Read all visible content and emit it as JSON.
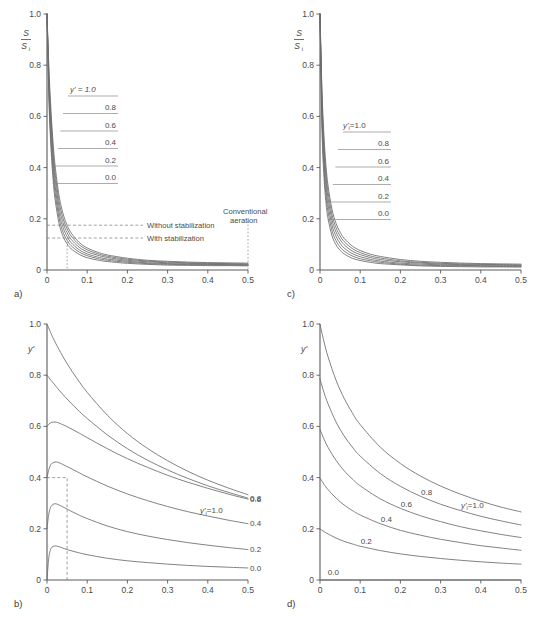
{
  "figure": {
    "panels": [
      "a",
      "b",
      "c",
      "d"
    ],
    "letters": {
      "a": "a)",
      "b": "b)",
      "c": "c)",
      "d": "d)"
    }
  },
  "axis": {
    "x_ticks": [
      "0",
      "0.1",
      "0.2",
      "0.3",
      "0.4",
      "0.5"
    ],
    "y_ticks": [
      "0",
      "0.2",
      "0.4",
      "0.6",
      "0.8",
      "1.0"
    ],
    "y_label_ac_numerator": "S",
    "y_label_ac_denominator": "S",
    "y_label_ac_denominator_sub": "i",
    "y_label_bd": "y'"
  },
  "panel_a": {
    "letter": "a)",
    "legend_head": "y' = 1.0",
    "legend_values": [
      "0.8",
      "0.6",
      "0.4",
      "0.2",
      "0.0"
    ],
    "annotation_without": "Without stabilization",
    "annotation_with": "With stabilization",
    "annotation_conventional_line1": "Conventional",
    "annotation_conventional_line2": "aeration",
    "without_stabilization_value": 0.175,
    "with_stabilization_value": 0.125,
    "marker_x": 0.05,
    "conventional_x": 0.5
  },
  "panel_b": {
    "letter": "b)",
    "legend_head": "y'",
    "legend_head_sub": "i",
    "legend_head_eq": "=1.0",
    "legend_values": [
      "0.8",
      "0.6",
      "0.4",
      "0.2",
      "0.0"
    ],
    "marker_x": 0.05,
    "marker_y": 0.4
  },
  "panel_c": {
    "letter": "c)",
    "legend_head": "y'",
    "legend_head_sub": "i",
    "legend_head_eq": "=1.0",
    "legend_values": [
      "0.8",
      "0.6",
      "0.4",
      "0.2",
      "0.0"
    ]
  },
  "panel_d": {
    "letter": "d)",
    "legend_head": "y'",
    "legend_head_sub": "i",
    "legend_head_eq": "=1.0",
    "legend_values": [
      "0.8",
      "0.6",
      "0.4",
      "0.2",
      "0.0"
    ]
  },
  "colors": {
    "axis": "#5a5a5a",
    "curve": "#6b6b6b",
    "text": "#4a4a4a",
    "annotation": "#7a7a7a",
    "background": "#ffffff"
  },
  "chart_data": [
    {
      "type": "line",
      "panel": "a",
      "title": "",
      "xlabel": "",
      "ylabel": "S/Si",
      "xlim": [
        0,
        0.5
      ],
      "ylim": [
        0,
        1.0
      ],
      "xticks": [
        0,
        0.1,
        0.2,
        0.3,
        0.4,
        0.5
      ],
      "yticks": [
        0,
        0.2,
        0.4,
        0.6,
        0.8,
        1.0
      ],
      "grid": false,
      "legend_position": "inside-left",
      "x": [
        0,
        0.005,
        0.01,
        0.015,
        0.02,
        0.03,
        0.04,
        0.05,
        0.06,
        0.08,
        0.1,
        0.125,
        0.15,
        0.2,
        0.25,
        0.3,
        0.35,
        0.4,
        0.45,
        0.5
      ],
      "series": [
        {
          "name": "y' = 1.0",
          "values": [
            1.0,
            0.78,
            0.62,
            0.5,
            0.41,
            0.29,
            0.22,
            0.175,
            0.145,
            0.108,
            0.086,
            0.07,
            0.059,
            0.046,
            0.038,
            0.034,
            0.031,
            0.029,
            0.028,
            0.027
          ]
        },
        {
          "name": "0.8",
          "values": [
            1.0,
            0.755,
            0.592,
            0.472,
            0.383,
            0.268,
            0.202,
            0.161,
            0.133,
            0.099,
            0.079,
            0.064,
            0.054,
            0.042,
            0.035,
            0.031,
            0.028,
            0.026,
            0.025,
            0.024
          ]
        },
        {
          "name": "0.6",
          "values": [
            1.0,
            0.73,
            0.563,
            0.443,
            0.356,
            0.246,
            0.184,
            0.146,
            0.12,
            0.089,
            0.071,
            0.058,
            0.049,
            0.038,
            0.032,
            0.028,
            0.026,
            0.024,
            0.023,
            0.022
          ]
        },
        {
          "name": "0.4",
          "values": [
            1.0,
            0.705,
            0.533,
            0.414,
            0.329,
            0.224,
            0.166,
            0.131,
            0.107,
            0.079,
            0.063,
            0.051,
            0.043,
            0.034,
            0.028,
            0.025,
            0.023,
            0.022,
            0.021,
            0.02
          ]
        },
        {
          "name": "0.2",
          "values": [
            1.0,
            0.678,
            0.503,
            0.385,
            0.303,
            0.203,
            0.148,
            0.116,
            0.095,
            0.07,
            0.056,
            0.045,
            0.038,
            0.03,
            0.025,
            0.022,
            0.021,
            0.02,
            0.019,
            0.018
          ]
        },
        {
          "name": "0.0",
          "values": [
            1.0,
            0.652,
            0.474,
            0.357,
            0.277,
            0.182,
            0.131,
            0.102,
            0.083,
            0.061,
            0.048,
            0.039,
            0.033,
            0.026,
            0.022,
            0.019,
            0.018,
            0.017,
            0.017,
            0.016
          ]
        }
      ],
      "annotations": [
        {
          "text": "Without stabilization",
          "y": 0.175,
          "type": "dashed-horizontal"
        },
        {
          "text": "With stabilization",
          "y": 0.125,
          "type": "dashed-horizontal"
        },
        {
          "text": "Conventional aeration",
          "x": 0.5,
          "type": "dotted-vertical"
        },
        {
          "x": 0.05,
          "type": "dotted-vertical-marker"
        }
      ]
    },
    {
      "type": "line",
      "panel": "b",
      "title": "",
      "xlabel": "",
      "ylabel": "y'",
      "xlim": [
        0,
        0.5
      ],
      "ylim": [
        0,
        1.0
      ],
      "xticks": [
        0,
        0.1,
        0.2,
        0.3,
        0.4,
        0.5
      ],
      "yticks": [
        0,
        0.2,
        0.4,
        0.6,
        0.8,
        1.0
      ],
      "grid": false,
      "legend_position": "right-edge",
      "x": [
        0,
        0.004,
        0.008,
        0.012,
        0.02,
        0.03,
        0.05,
        0.075,
        0.1,
        0.15,
        0.2,
        0.25,
        0.3,
        0.35,
        0.4,
        0.45,
        0.5
      ],
      "series": [
        {
          "name": "y'i = 1.0",
          "values": [
            1.0,
            0.985,
            0.97,
            0.956,
            0.93,
            0.9,
            0.845,
            0.786,
            0.733,
            0.644,
            0.572,
            0.514,
            0.466,
            0.425,
            0.39,
            0.36,
            0.333
          ]
        },
        {
          "name": "0.8",
          "values": [
            0.8,
            0.792,
            0.784,
            0.776,
            0.761,
            0.742,
            0.707,
            0.667,
            0.631,
            0.567,
            0.513,
            0.468,
            0.43,
            0.397,
            0.368,
            0.343,
            0.32
          ]
        },
        {
          "name": "0.6",
          "values": [
            0.6,
            0.608,
            0.613,
            0.616,
            0.617,
            0.613,
            0.599,
            0.578,
            0.556,
            0.513,
            0.474,
            0.44,
            0.409,
            0.382,
            0.358,
            0.336,
            0.316
          ]
        },
        {
          "name": "0.4",
          "values": [
            0.4,
            0.428,
            0.446,
            0.455,
            0.461,
            0.458,
            0.443,
            0.423,
            0.403,
            0.367,
            0.336,
            0.31,
            0.287,
            0.267,
            0.25,
            0.234,
            0.22
          ]
        },
        {
          "name": "0.2",
          "values": [
            0.2,
            0.253,
            0.28,
            0.292,
            0.298,
            0.293,
            0.277,
            0.257,
            0.24,
            0.211,
            0.189,
            0.172,
            0.158,
            0.146,
            0.136,
            0.127,
            0.119
          ]
        },
        {
          "name": "0.0",
          "values": [
            0.0,
            0.081,
            0.115,
            0.128,
            0.133,
            0.13,
            0.119,
            0.108,
            0.099,
            0.085,
            0.075,
            0.068,
            0.062,
            0.057,
            0.053,
            0.05,
            0.047
          ]
        }
      ],
      "annotations": [
        {
          "x": 0.05,
          "y": 0.4,
          "type": "dashed-marker"
        }
      ]
    },
    {
      "type": "line",
      "panel": "c",
      "title": "",
      "xlabel": "",
      "ylabel": "S/Si",
      "xlim": [
        0,
        0.5
      ],
      "ylim": [
        0,
        1.0
      ],
      "xticks": [
        0,
        0.1,
        0.2,
        0.3,
        0.4,
        0.5
      ],
      "yticks": [
        0,
        0.2,
        0.4,
        0.6,
        0.8,
        1.0
      ],
      "grid": false,
      "legend_position": "inside-left",
      "x": [
        0,
        0.005,
        0.01,
        0.015,
        0.02,
        0.03,
        0.04,
        0.05,
        0.06,
        0.08,
        0.1,
        0.125,
        0.15,
        0.2,
        0.25,
        0.3,
        0.35,
        0.4,
        0.45,
        0.5
      ],
      "series": [
        {
          "name": "y'i = 1.0",
          "values": [
            1.0,
            0.7,
            0.52,
            0.405,
            0.33,
            0.236,
            0.182,
            0.148,
            0.124,
            0.094,
            0.076,
            0.062,
            0.053,
            0.041,
            0.034,
            0.03,
            0.027,
            0.025,
            0.024,
            0.023
          ]
        },
        {
          "name": "0.8",
          "values": [
            1.0,
            0.672,
            0.49,
            0.378,
            0.305,
            0.215,
            0.165,
            0.133,
            0.111,
            0.084,
            0.068,
            0.055,
            0.047,
            0.036,
            0.03,
            0.026,
            0.024,
            0.022,
            0.021,
            0.02
          ]
        },
        {
          "name": "0.6",
          "values": [
            1.0,
            0.643,
            0.459,
            0.35,
            0.28,
            0.195,
            0.148,
            0.119,
            0.099,
            0.074,
            0.06,
            0.049,
            0.041,
            0.032,
            0.027,
            0.023,
            0.021,
            0.02,
            0.019,
            0.018
          ]
        },
        {
          "name": "0.4",
          "values": [
            1.0,
            0.612,
            0.427,
            0.321,
            0.254,
            0.174,
            0.131,
            0.104,
            0.086,
            0.064,
            0.052,
            0.042,
            0.035,
            0.027,
            0.023,
            0.02,
            0.018,
            0.017,
            0.016,
            0.016
          ]
        },
        {
          "name": "0.2",
          "values": [
            1.0,
            0.58,
            0.394,
            0.291,
            0.228,
            0.153,
            0.114,
            0.09,
            0.074,
            0.055,
            0.044,
            0.036,
            0.03,
            0.023,
            0.019,
            0.017,
            0.016,
            0.015,
            0.014,
            0.014
          ]
        },
        {
          "name": "0.0",
          "values": [
            1.0,
            0.546,
            0.36,
            0.261,
            0.201,
            0.133,
            0.098,
            0.077,
            0.063,
            0.046,
            0.037,
            0.03,
            0.025,
            0.02,
            0.016,
            0.014,
            0.013,
            0.012,
            0.012,
            0.011
          ]
        }
      ],
      "annotations": []
    },
    {
      "type": "line",
      "panel": "d",
      "title": "",
      "xlabel": "",
      "ylabel": "y'",
      "xlim": [
        0,
        0.5
      ],
      "ylim": [
        0,
        1.0
      ],
      "xticks": [
        0,
        0.1,
        0.2,
        0.3,
        0.4,
        0.5
      ],
      "yticks": [
        0,
        0.2,
        0.4,
        0.6,
        0.8,
        1.0
      ],
      "grid": false,
      "legend_position": "inline-on-curves",
      "x": [
        0,
        0.01,
        0.02,
        0.04,
        0.06,
        0.08,
        0.1,
        0.15,
        0.2,
        0.25,
        0.3,
        0.35,
        0.4,
        0.45,
        0.5
      ],
      "series": [
        {
          "name": "y'i = 1.0",
          "values": [
            1.0,
            0.93,
            0.872,
            0.78,
            0.71,
            0.654,
            0.607,
            0.519,
            0.455,
            0.406,
            0.367,
            0.335,
            0.308,
            0.285,
            0.266
          ]
        },
        {
          "name": "0.8",
          "values": [
            0.785,
            0.732,
            0.688,
            0.617,
            0.563,
            0.52,
            0.484,
            0.416,
            0.366,
            0.327,
            0.296,
            0.271,
            0.249,
            0.231,
            0.215
          ]
        },
        {
          "name": "0.6",
          "values": [
            0.588,
            0.55,
            0.518,
            0.467,
            0.427,
            0.395,
            0.368,
            0.317,
            0.28,
            0.251,
            0.228,
            0.208,
            0.192,
            0.178,
            0.166
          ]
        },
        {
          "name": "0.4",
          "values": [
            0.398,
            0.374,
            0.353,
            0.32,
            0.293,
            0.272,
            0.254,
            0.22,
            0.194,
            0.175,
            0.159,
            0.146,
            0.134,
            0.125,
            0.116
          ]
        },
        {
          "name": "0.2",
          "values": [
            0.2,
            0.189,
            0.18,
            0.164,
            0.151,
            0.141,
            0.132,
            0.115,
            0.102,
            0.092,
            0.084,
            0.077,
            0.071,
            0.066,
            0.062
          ]
        },
        {
          "name": "0.0",
          "values": [
            0.0,
            0.0,
            0.0,
            0.0,
            0.0,
            0.0,
            0.0,
            0.0,
            0.0,
            0.0,
            0.0,
            0.0,
            0.0,
            0.0,
            0.0
          ]
        }
      ],
      "annotations": []
    }
  ]
}
